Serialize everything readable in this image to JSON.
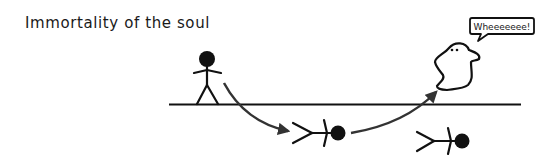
{
  "title": "Immortality of the soul",
  "speech_bubble": {
    "text": "Wheeeeeee!"
  },
  "colors": {
    "ink": "#111111",
    "arrow": "#333333",
    "background": "#ffffff"
  },
  "elements": {
    "ground_line": "ground",
    "figures": [
      {
        "name": "standing-stick-figure",
        "state": "alive"
      },
      {
        "name": "fallen-stick-figure",
        "state": "dead"
      },
      {
        "name": "ghost",
        "state": "spirit"
      },
      {
        "name": "fallen-stick-figure-2",
        "state": "dead"
      }
    ],
    "arrows": [
      {
        "from": "standing-stick-figure",
        "to": "fallen-stick-figure"
      },
      {
        "from": "fallen-stick-figure",
        "to": "ghost"
      }
    ]
  }
}
